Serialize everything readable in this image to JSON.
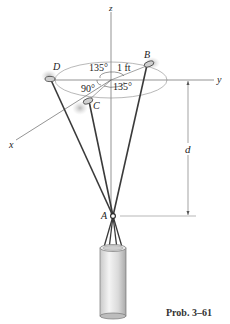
{
  "figure": {
    "caption": "Prob. 3–61",
    "axes": {
      "x_label": "x",
      "y_label": "y",
      "z_label": "z"
    },
    "points": {
      "A": "A",
      "B": "B",
      "C": "C",
      "D": "D"
    },
    "angles": {
      "angle_DB": "135°",
      "angle_DC": "90°",
      "angle_CB": "135°"
    },
    "dimensions": {
      "radius": "1 ft",
      "height": "d"
    },
    "colors": {
      "cable": "#3a3a3a",
      "axis": "#555555",
      "cylinder_light": "#f0f0f0",
      "cylinder_dark": "#b5b5b5"
    }
  }
}
